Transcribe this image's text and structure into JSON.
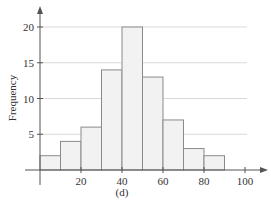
{
  "chart_data": {
    "type": "bar",
    "subtype": "histogram",
    "title": "",
    "caption": "(d)",
    "xlabel": "",
    "ylabel": "Frequency",
    "bin_edges": [
      0,
      10,
      20,
      30,
      40,
      50,
      60,
      70,
      80,
      90
    ],
    "categories": [
      "0-10",
      "10-20",
      "20-30",
      "30-40",
      "40-50",
      "50-60",
      "60-70",
      "70-80",
      "80-90"
    ],
    "values": [
      2,
      4,
      6,
      14,
      20,
      13,
      7,
      3,
      2
    ],
    "xlim": [
      0,
      110
    ],
    "ylim": [
      0,
      23
    ],
    "x_ticks": [
      20,
      40,
      60,
      80,
      100
    ],
    "y_ticks": [
      5,
      10,
      15,
      20
    ],
    "grid": "horizontal",
    "legend": null
  },
  "colors": {
    "bar_fill": "#f2f2f2",
    "bar_stroke": "#8a8a8a",
    "axis": "#555555",
    "grid": "#d9d9d9",
    "text": "#333333"
  }
}
